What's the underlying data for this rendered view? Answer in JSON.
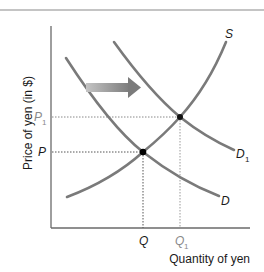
{
  "diagram": {
    "y_axis_label": "Price of yen (in $)",
    "x_axis_label": "Quantity of yen",
    "curves": {
      "supply": {
        "label": "S"
      },
      "demand": {
        "label": "D"
      },
      "demand_shifted": {
        "label": "D",
        "subscript": "1"
      }
    },
    "price_ticks": {
      "p": {
        "label": "P"
      },
      "p1": {
        "label": "P",
        "subscript": "1"
      }
    },
    "quantity_ticks": {
      "q": {
        "label": "Q"
      },
      "q1": {
        "label": "Q",
        "subscript": "1"
      }
    },
    "shift_arrow": {
      "direction": "right"
    },
    "colors": {
      "curve": "#7a7a7a",
      "axis": "#666666",
      "guide": "#555555",
      "arrow_start": "#bdbdbd",
      "arrow_end": "#7d7d7d",
      "point": "#000000"
    }
  }
}
